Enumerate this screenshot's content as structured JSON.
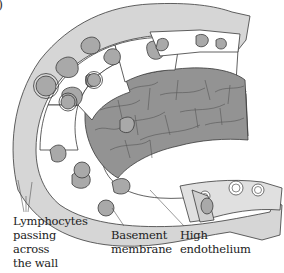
{
  "figure": {
    "panel_mark": ")",
    "colors": {
      "background": "#ffffff",
      "outline": "#3a3a3a",
      "nucleus_gray": "#a9a9a9",
      "lumen_dark_gray": "#8f8f8f",
      "wall_light_gray": "#d3d3d3",
      "cell_white": "#ffffff"
    }
  },
  "labels": {
    "lymphocytes": [
      "Lymphocytes",
      "passing",
      "across",
      "the wall"
    ],
    "basement": [
      "Basement",
      "membrane"
    ],
    "high_endothelium": [
      "High",
      "endothelium"
    ]
  }
}
